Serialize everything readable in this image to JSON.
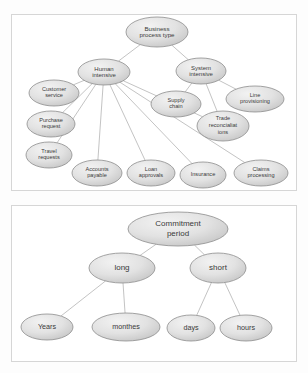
{
  "document": {
    "title": "Business process type and Commitment period taxonomies",
    "panel_count": 2
  },
  "diagrams": [
    {
      "id": "business-process-type",
      "name": "Business process type hierarchy",
      "root": {
        "id": "root",
        "label": "Business process type",
        "lines": [
          "Business",
          "process type"
        ],
        "cx": 157,
        "cy": 32,
        "rx": 31,
        "ry": 15
      },
      "nodes": [
        {
          "id": "human-intensive",
          "label": "Human intensive",
          "lines": [
            "Human",
            "intensive"
          ],
          "cx": 104,
          "cy": 72,
          "rx": 26,
          "ry": 13,
          "level": "mid"
        },
        {
          "id": "system-intensive",
          "label": "System intensive",
          "lines": [
            "System",
            "intensive"
          ],
          "cx": 201,
          "cy": 71,
          "rx": 25,
          "ry": 13,
          "level": "mid"
        },
        {
          "id": "customer-service",
          "label": "Customer service",
          "lines": [
            "Customer",
            "service"
          ],
          "cx": 54,
          "cy": 93,
          "rx": 25,
          "ry": 13,
          "level": "leaf"
        },
        {
          "id": "purchase-request",
          "label": "Purchase request",
          "lines": [
            "Purchase",
            "request"
          ],
          "cx": 51,
          "cy": 124,
          "rx": 24,
          "ry": 13,
          "level": "leaf"
        },
        {
          "id": "travel-requests",
          "label": "Travel requests",
          "lines": [
            "Travel",
            "requests"
          ],
          "cx": 49,
          "cy": 155,
          "rx": 23,
          "ry": 13,
          "level": "leaf"
        },
        {
          "id": "supply-chain",
          "label": "Supply chain",
          "lines": [
            "Supply",
            "chain"
          ],
          "cx": 176,
          "cy": 104,
          "rx": 25,
          "ry": 13,
          "level": "leaf"
        },
        {
          "id": "line-provisioning",
          "label": "Line provisioning",
          "lines": [
            "Line",
            "provisioning"
          ],
          "cx": 255,
          "cy": 99,
          "rx": 29,
          "ry": 13,
          "level": "leaf"
        },
        {
          "id": "trade-reconciliations",
          "label": "Trade reconcialiat ions",
          "lines": [
            "Trade",
            "reconcialiat",
            "ions"
          ],
          "cx": 223,
          "cy": 126,
          "rx": 26,
          "ry": 15,
          "level": "leaf"
        },
        {
          "id": "accounts-payable",
          "label": "Accounts payable",
          "lines": [
            "Accounts",
            "payable"
          ],
          "cx": 97,
          "cy": 173,
          "rx": 25,
          "ry": 13,
          "level": "leaf"
        },
        {
          "id": "loan-approvals",
          "label": "Loan approvals",
          "lines": [
            "Loan",
            "approvals"
          ],
          "cx": 151,
          "cy": 173,
          "rx": 24,
          "ry": 13,
          "level": "leaf"
        },
        {
          "id": "insurance",
          "label": "Insurance",
          "lines": [
            "Insurance"
          ],
          "cx": 203,
          "cy": 175,
          "rx": 23,
          "ry": 13,
          "level": "leaf"
        },
        {
          "id": "claims-processing",
          "label": "Claims processing",
          "lines": [
            "Claims",
            "processing"
          ],
          "cx": 261,
          "cy": 173,
          "rx": 27,
          "ry": 13,
          "level": "leaf"
        }
      ],
      "edges": [
        {
          "from": "root",
          "to": "human-intensive"
        },
        {
          "from": "root",
          "to": "system-intensive"
        },
        {
          "from": "human-intensive",
          "to": "customer-service"
        },
        {
          "from": "human-intensive",
          "to": "purchase-request"
        },
        {
          "from": "human-intensive",
          "to": "travel-requests"
        },
        {
          "from": "human-intensive",
          "to": "accounts-payable"
        },
        {
          "from": "human-intensive",
          "to": "loan-approvals"
        },
        {
          "from": "human-intensive",
          "to": "insurance"
        },
        {
          "from": "human-intensive",
          "to": "claims-processing"
        },
        {
          "from": "human-intensive",
          "to": "trade-reconciliations"
        },
        {
          "from": "system-intensive",
          "to": "supply-chain"
        },
        {
          "from": "system-intensive",
          "to": "line-provisioning"
        },
        {
          "from": "system-intensive",
          "to": "trade-reconciliations"
        }
      ]
    },
    {
      "id": "commitment-period",
      "name": "Commitment period hierarchy",
      "root": {
        "id": "b-root",
        "label": "Commitment period",
        "lines": [
          "Commitment",
          "period"
        ],
        "cx": 178,
        "cy": 229,
        "rx": 50,
        "ry": 17
      },
      "nodes": [
        {
          "id": "long",
          "label": "long",
          "lines": [
            "long"
          ],
          "cx": 122,
          "cy": 268,
          "rx": 33,
          "ry": 15,
          "level": "mid"
        },
        {
          "id": "short",
          "label": "short",
          "lines": [
            "short"
          ],
          "cx": 218,
          "cy": 268,
          "rx": 28,
          "ry": 15,
          "level": "mid"
        },
        {
          "id": "years",
          "label": "Years",
          "lines": [
            "Years"
          ],
          "cx": 47,
          "cy": 327,
          "rx": 26,
          "ry": 13,
          "level": "leaf"
        },
        {
          "id": "monthes",
          "label": "monthes",
          "lines": [
            "monthes"
          ],
          "cx": 126,
          "cy": 327,
          "rx": 34,
          "ry": 14,
          "level": "leaf"
        },
        {
          "id": "days",
          "label": "days",
          "lines": [
            "days"
          ],
          "cx": 191,
          "cy": 328,
          "rx": 24,
          "ry": 13,
          "level": "leaf"
        },
        {
          "id": "hours",
          "label": "hours",
          "lines": [
            "hours"
          ],
          "cx": 246,
          "cy": 328,
          "rx": 26,
          "ry": 13,
          "level": "leaf"
        }
      ],
      "edges": [
        {
          "from": "b-root",
          "to": "long"
        },
        {
          "from": "b-root",
          "to": "short"
        },
        {
          "from": "long",
          "to": "years"
        },
        {
          "from": "long",
          "to": "monthes"
        },
        {
          "from": "short",
          "to": "days"
        },
        {
          "from": "short",
          "to": "hours"
        }
      ]
    }
  ],
  "colors": {
    "node_fill_light": "#e8e8e8",
    "node_fill_dark": "#c9c9c9",
    "node_stroke": "#8d8d8d",
    "edge_stroke": "#9a9a9a",
    "panel_border": "#d6d6d6",
    "text": "#3a3a3a",
    "background": "#fdfdfd"
  }
}
